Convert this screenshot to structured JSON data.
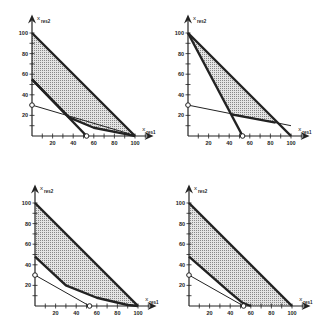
{
  "diagram": {
    "axis_labels": {
      "x": "x",
      "x_sub": "res1",
      "y": "x",
      "y_sub": "res2"
    },
    "x_ticks": [
      "20",
      "40",
      "60",
      "80",
      "100"
    ],
    "y_ticks": [
      "20",
      "40",
      "60",
      "80",
      "100"
    ],
    "shade_color": "#c8c8c8",
    "line_color": "#222222",
    "panels": [
      {
        "id": "top-left",
        "origin": [
          32,
          136
        ],
        "shaded": [
          [
            0,
            100
          ],
          [
            100,
            0
          ],
          [
            90,
            2
          ],
          [
            60,
            8
          ],
          [
            36,
            18
          ],
          [
            0,
            55
          ]
        ],
        "thick_lines": [
          [
            [
              0,
              100
            ],
            [
              100,
              0
            ]
          ],
          [
            [
              0,
              55
            ],
            [
              36,
              18
            ],
            [
              60,
              8
            ],
            [
              90,
              2
            ],
            [
              100,
              0
            ]
          ],
          [
            [
              0,
              55
            ],
            [
              53,
              0
            ]
          ]
        ],
        "thin_lines": [
          [
            [
              0,
              30
            ],
            [
              95,
              2
            ]
          ]
        ],
        "circles": [
          [
            0,
            30
          ],
          [
            53,
            0
          ]
        ]
      },
      {
        "id": "top-right",
        "origin": [
          188,
          136
        ],
        "shaded": [
          [
            0,
            100
          ],
          [
            85,
            13
          ],
          [
            42,
            21
          ]
        ],
        "thick_lines": [
          [
            [
              0,
              100
            ],
            [
              100,
              0
            ]
          ],
          [
            [
              0,
              100
            ],
            [
              53,
              0
            ]
          ],
          [
            [
              42,
              21
            ],
            [
              85,
              13
            ]
          ]
        ],
        "thin_lines": [
          [
            [
              0,
              30
            ],
            [
              100,
              10
            ]
          ]
        ],
        "circles": [
          [
            0,
            30
          ],
          [
            53,
            0
          ]
        ]
      },
      {
        "id": "bottom-left",
        "origin": [
          35,
          306
        ],
        "shaded": [
          [
            0,
            100
          ],
          [
            100,
            0
          ],
          [
            90,
            1
          ],
          [
            60,
            8
          ],
          [
            30,
            20
          ],
          [
            0,
            48
          ]
        ],
        "thick_lines": [
          [
            [
              0,
              100
            ],
            [
              100,
              0
            ]
          ],
          [
            [
              0,
              48
            ],
            [
              30,
              20
            ],
            [
              60,
              8
            ],
            [
              90,
              1
            ],
            [
              100,
              0
            ]
          ]
        ],
        "thin_lines": [
          [
            [
              0,
              30
            ],
            [
              53,
              0
            ]
          ]
        ],
        "circles": [
          [
            0,
            30
          ],
          [
            53,
            0
          ]
        ]
      },
      {
        "id": "bottom-right",
        "origin": [
          189,
          306
        ],
        "shaded": [
          [
            0,
            100
          ],
          [
            100,
            0
          ],
          [
            60,
            0
          ],
          [
            52,
            3
          ],
          [
            40,
            13
          ],
          [
            0,
            48
          ]
        ],
        "thick_lines": [
          [
            [
              0,
              100
            ],
            [
              100,
              0
            ]
          ],
          [
            [
              0,
              48
            ],
            [
              40,
              13
            ],
            [
              52,
              3
            ],
            [
              60,
              0
            ]
          ]
        ],
        "thin_lines": [
          [
            [
              0,
              30
            ],
            [
              53,
              0
            ]
          ]
        ],
        "circles": [
          [
            0,
            30
          ],
          [
            53,
            0
          ]
        ]
      }
    ]
  }
}
